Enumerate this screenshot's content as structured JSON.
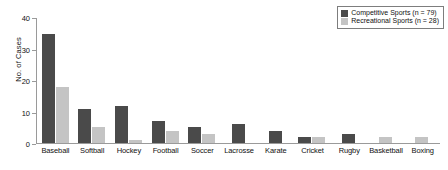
{
  "chart_data": {
    "type": "bar",
    "title": "",
    "xlabel": "",
    "ylabel": "No. of Cases",
    "ylim": [
      0,
      40
    ],
    "yticks": [
      0,
      10,
      20,
      30,
      40
    ],
    "grid": false,
    "legend_position": "top-right",
    "categories": [
      "Baseball",
      "Softball",
      "Hockey",
      "Football",
      "Soccer",
      "Lacrosse",
      "Karate",
      "Cricket",
      "Rugby",
      "Basketball",
      "Boxing"
    ],
    "series": [
      {
        "name": "Competitive Sports (n = 79)",
        "color": "#4a4a4a",
        "values": [
          35,
          11,
          12,
          7,
          5,
          6,
          4,
          2,
          3,
          0,
          0
        ]
      },
      {
        "name": "Recreational Sports (n = 28)",
        "color": "#c4c4c4",
        "values": [
          18,
          5,
          1,
          4,
          3,
          0,
          0,
          2,
          0,
          2,
          2
        ]
      }
    ]
  },
  "axis": {
    "y_title": "No. of Cases",
    "y_tick_labels": [
      "0",
      "10",
      "20",
      "30",
      "40"
    ]
  },
  "legend": {
    "items": [
      {
        "label": "Competitive Sports (n = 79)",
        "swatch": "competitive"
      },
      {
        "label": "Recreational Sports (n = 28)",
        "swatch": "recreational"
      }
    ]
  }
}
